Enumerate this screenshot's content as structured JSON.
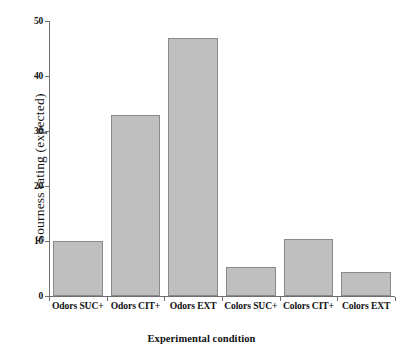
{
  "chart_data": {
    "type": "bar",
    "title": "",
    "xlabel": "Experimental condition",
    "ylabel": "Sourness rating (expected)",
    "categories": [
      "Odors  SUC+",
      "Odors CIT+",
      "Odors EXT",
      "Colors SUC+",
      "Colors CIT+",
      "Colors EXT"
    ],
    "values": [
      10,
      33,
      47,
      5.3,
      10.3,
      4.3
    ],
    "ylim": [
      0,
      50
    ],
    "yticks": [
      0,
      10,
      20,
      30,
      40,
      50
    ],
    "ytick_labels": [
      "0",
      "10",
      "20",
      "30",
      "40",
      "50"
    ],
    "grid": false,
    "legend": null,
    "bar_color": "#bfbfbf",
    "bar_edge_color": "#8a8a8a",
    "axis_color": "#6e6e6e",
    "background": "#ffffff"
  }
}
